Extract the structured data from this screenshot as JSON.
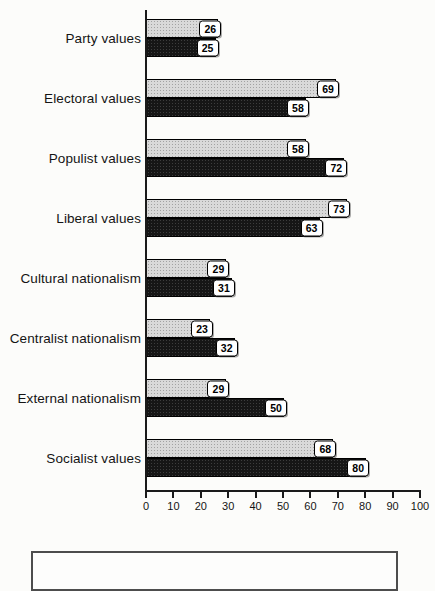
{
  "chart_data": {
    "type": "bar",
    "orientation": "horizontal",
    "title": "",
    "xlabel": "",
    "ylabel": "",
    "categories": [
      "Party values",
      "Electoral values",
      "Populist values",
      "Liberal values",
      "Cultural nationalism",
      "Centralist nationalism",
      "External nationalism",
      "Socialist values"
    ],
    "series": [
      {
        "name": "gray-stippled",
        "color": "#d9d9d9",
        "values": [
          26,
          69,
          58,
          73,
          29,
          23,
          29,
          68
        ]
      },
      {
        "name": "black-stippled",
        "color": "#161616",
        "values": [
          25,
          58,
          72,
          63,
          31,
          32,
          50,
          80
        ]
      }
    ],
    "xlim": [
      0,
      100
    ],
    "x_ticks": [
      0,
      10,
      20,
      30,
      40,
      50,
      60,
      70,
      80,
      90,
      100
    ],
    "grid": false,
    "legend_position": "bottom (box visible but contents cut off)"
  },
  "colors": {
    "axis": "#1a1a1a",
    "background": "#fcfcfa",
    "value_chip_bg": "#ffffff",
    "value_chip_border": "#000000"
  }
}
